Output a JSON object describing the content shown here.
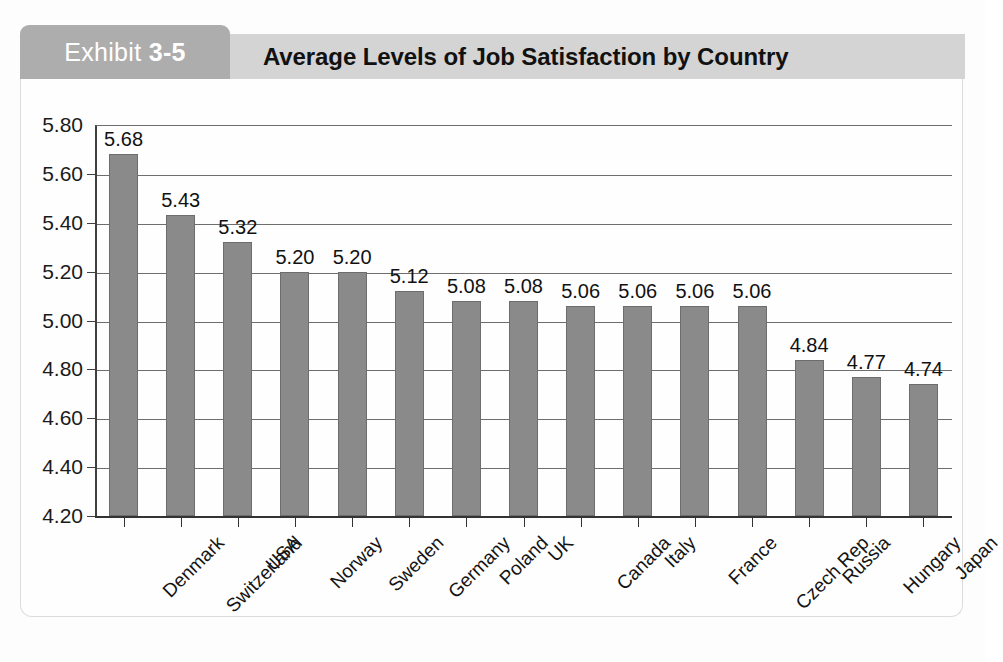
{
  "exhibit": {
    "tab_prefix": "Exhibit",
    "tab_number": "3-5",
    "title": "Average Levels of Job Satisfaction by Country"
  },
  "chart_data": {
    "type": "bar",
    "title": "Average Levels of Job Satisfaction by Country",
    "xlabel": "",
    "ylabel": "",
    "ylim": [
      4.2,
      5.8
    ],
    "ytick_step": 0.2,
    "ytick_labels": [
      "5.80",
      "5.60",
      "5.40",
      "5.20",
      "5.00",
      "4.80",
      "4.60",
      "4.40",
      "4.20"
    ],
    "grid": true,
    "legend": false,
    "bar_color": "#8a8a8a",
    "bar_border_color": "#6d6d6d",
    "categories": [
      "Denmark",
      "Switzerland",
      "USA",
      "Norway",
      "Sweden",
      "Germany",
      "Poland",
      "UK",
      "Canada",
      "Italy",
      "France",
      "Czech Rep",
      "Russia",
      "Hungary",
      "Japan"
    ],
    "values": [
      5.68,
      5.43,
      5.32,
      5.2,
      5.2,
      5.12,
      5.08,
      5.08,
      5.06,
      5.06,
      5.06,
      5.06,
      4.84,
      4.77,
      4.74
    ],
    "data_labels": [
      "5.68",
      "5.43",
      "5.32",
      "5.20",
      "5.20",
      "5.12",
      "5.08",
      "5.08",
      "5.06",
      "5.06",
      "5.06",
      "5.06",
      "4.84",
      "4.77",
      "4.74"
    ]
  },
  "theme": {
    "tab_bg": "#adadad",
    "title_bar_bg": "#d4d4d4",
    "frame_border": "#dcdcdc",
    "axis_color": "#333333",
    "grid_color": "#6e6e6e"
  }
}
